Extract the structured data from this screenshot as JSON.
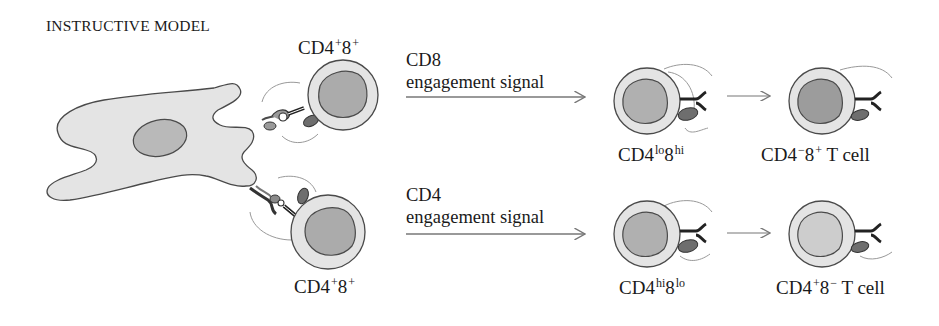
{
  "title": "INSTRUCTIVE MODEL",
  "colors": {
    "cell_membrane": "#e6e6e6",
    "cell_outline": "#4a4a4a",
    "nucleus_dark": "#a8a8a8",
    "nucleus_mid": "#b4b4b4",
    "nucleus_light": "#cfcfcf",
    "receptor": "#2a2a2a",
    "coreceptor": "#7a7a7a"
  },
  "top_pathway": {
    "start_cell_label": {
      "base": "CD4",
      "sup1": "+",
      "mid": "8",
      "sup2": "+"
    },
    "signal_line1": "CD8",
    "signal_line2": "engagement signal",
    "intermediate_label": {
      "base": "CD4",
      "sup1": "lo",
      "mid": "8",
      "sup2": "hi"
    },
    "final_label": {
      "base": "CD4",
      "sup1": "−",
      "mid": "8",
      "sup2": "+",
      "suffix": " T cell"
    }
  },
  "bottom_pathway": {
    "start_cell_label": {
      "base": "CD4",
      "sup1": "+",
      "mid": "8",
      "sup2": "+"
    },
    "signal_line1": "CD4",
    "signal_line2": "engagement signal",
    "intermediate_label": {
      "base": "CD4",
      "sup1": "hi",
      "mid": "8",
      "sup2": "lo"
    },
    "final_label": {
      "base": "CD4",
      "sup1": "+",
      "mid": "8",
      "sup2": "−",
      "suffix": " T cell"
    }
  }
}
